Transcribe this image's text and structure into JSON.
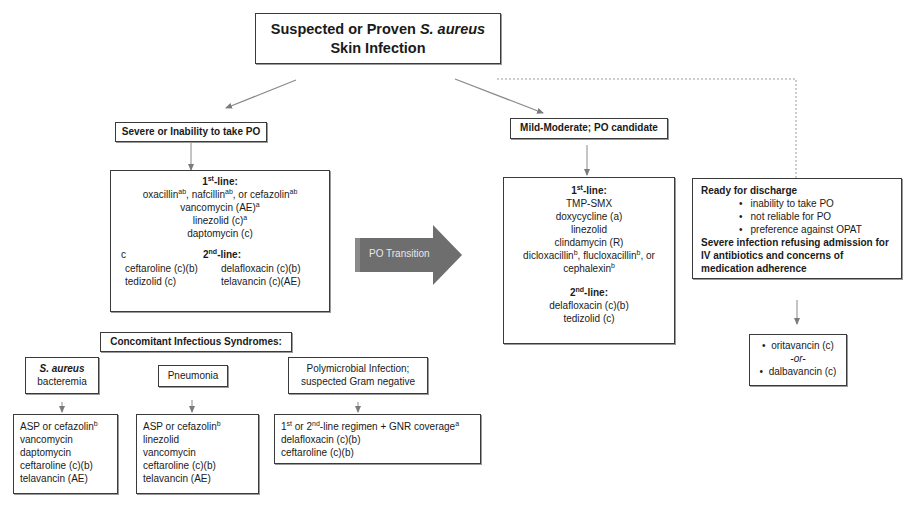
{
  "title": {
    "line1_prefix": "Suspected or Proven ",
    "line1_italic": "S. aureus",
    "line2": "Skin Infection"
  },
  "severe": {
    "label": "Severe or Inability to take PO",
    "first_line_header": "1st-line:",
    "first_line_header_num": "1",
    "first_line_header_sup": "st",
    "first_line_header_rest": "-line:",
    "first_line_items": [
      {
        "text": "oxacillin",
        "sup": "ab"
      },
      {
        "text": "nafcillin",
        "sup": "ab"
      },
      {
        "text": "cefazolin",
        "sup": "ab"
      }
    ],
    "first_line_row1_sep1": ", ",
    "first_line_row1_sep2": ", or ",
    "vancomycin": "vancomycin (AE)",
    "vancomycin_sup": "a",
    "linezolid": "linezolid (c)",
    "linezolid_sup": "a",
    "daptomycin": "daptomycin (c)",
    "stray_c": "c",
    "second_line_num": "2",
    "second_line_sup": "nd",
    "second_line_rest": "-line:",
    "second_line_items": [
      "ceftaroline (c)(b)",
      "delafloxacin (c)(b)",
      "tedizolid (c)",
      "telavancin (c)(AE)"
    ]
  },
  "po_transition": {
    "label": "PO Transition"
  },
  "concomitant": {
    "label": "Concomitant Infectious Syndromes:",
    "bacteremia": {
      "label_italic": "S. aureus",
      "label_rest": "bacteremia",
      "items": [
        "ASP or cefazolin",
        "vancomycin",
        "daptomycin",
        "ceftaroline (c)(b)",
        "telavancin (AE)"
      ],
      "first_sup": "b"
    },
    "pneumonia": {
      "label": "Pneumonia",
      "items": [
        "ASP or cefazolin",
        "linezolid",
        "vancomycin",
        "ceftaroline (c)(b)",
        "telavancin (AE)"
      ],
      "first_sup": "b"
    },
    "polymicrobial": {
      "label_line1": "Polymicrobial Infection;",
      "label_line2": "suspected Gram negative",
      "item1_num1": "1",
      "item1_sup1": "st",
      "item1_mid": " or 2",
      "item1_sup2": "nd",
      "item1_rest": "-line regimen + GNR coverage",
      "item1_sup3": "a",
      "items": [
        "delafloxacin (c)(b)",
        "ceftaroline (c)(b)"
      ]
    }
  },
  "mild": {
    "label": "Mild-Moderate; PO candidate",
    "first_line_num": "1",
    "first_line_sup": "st",
    "first_line_rest": "-line:",
    "first_line_items": [
      "TMP-SMX",
      "doxycycline (a)",
      "linezolid",
      "clindamycin (R)"
    ],
    "beta_lactams": {
      "a": "dicloxacillin",
      "a_sup": "b",
      "sep1": ", ",
      "b": "flucloxacillin",
      "b_sup": "b",
      "sep2": ", or",
      "c": "cephalexin",
      "c_sup": "b"
    },
    "second_line_num": "2",
    "second_line_sup": "nd",
    "second_line_rest": "-line:",
    "second_line_items": [
      "delafloxacin (c)(b)",
      "tedizolid (c)"
    ]
  },
  "discharge": {
    "header": "Ready for discharge",
    "bullets": [
      "inability to take PO",
      "not reliable for PO",
      "preference against OPAT"
    ],
    "severe_text": "Severe infection refusing admission for IV antibiotics and concerns of medication adherence",
    "options": {
      "opt1": "oritavancin (c)",
      "or": "-or-",
      "opt2": "dalbavancin (c)"
    }
  },
  "colors": {
    "border": "#3a3a3a",
    "arrow_fill": "#6e6e6e",
    "arrow_text": "#e8e8e8",
    "connector": "#7a7a7a"
  }
}
